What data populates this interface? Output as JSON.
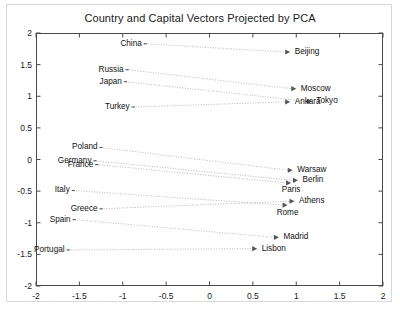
{
  "chart_data": {
    "type": "scatter",
    "title": "Country and Capital Vectors Projected by PCA",
    "xlabel": "",
    "ylabel": "",
    "xlim": [
      -2,
      2
    ],
    "ylim": [
      -2,
      2
    ],
    "grid": false,
    "legend": null,
    "xticks": [
      "-2",
      "-1.5",
      "-1",
      "-0.5",
      "0",
      "0.5",
      "1",
      "1.5",
      "2"
    ],
    "xtickvalues": [
      -2,
      -1.5,
      -1,
      -0.5,
      0,
      0.5,
      1,
      1.5,
      2
    ],
    "yticks": [
      "-2",
      "-1.5",
      "-1",
      "-0.5",
      "0",
      "0.5",
      "1",
      "1.5",
      "2"
    ],
    "ytickvalues": [
      -2,
      -1.5,
      -1,
      -0.5,
      0,
      0.5,
      1,
      1.5,
      2
    ],
    "annotation": "Each country is connected by a dotted arrow to its capital city; the country-to-capital offsets are nearly parallel.",
    "pairs": [
      {
        "country": "China",
        "capital": "Beijing",
        "country_xy": [
          -0.74,
          1.83
        ],
        "capital_xy": [
          0.93,
          1.7
        ],
        "country_anchor": "right",
        "capital_anchor": "left"
      },
      {
        "country": "Russia",
        "capital": "Moscow",
        "country_xy": [
          -0.95,
          1.42
        ],
        "capital_xy": [
          1.0,
          1.12
        ],
        "country_anchor": "right",
        "capital_anchor": "left"
      },
      {
        "country": "Japan",
        "capital": "Tokyo",
        "country_xy": [
          -0.97,
          1.23
        ],
        "capital_xy": [
          1.18,
          0.92
        ],
        "country_anchor": "right",
        "capital_anchor": "left"
      },
      {
        "country": "Turkey",
        "capital": "Ankara",
        "country_xy": [
          -0.88,
          0.83
        ],
        "capital_xy": [
          0.93,
          0.91
        ],
        "country_anchor": "right",
        "capital_anchor": "left"
      },
      {
        "country": "Poland",
        "capital": "Warsaw",
        "country_xy": [
          -1.25,
          0.19
        ],
        "capital_xy": [
          0.96,
          -0.17
        ],
        "country_anchor": "right",
        "capital_anchor": "left"
      },
      {
        "country": "Germany",
        "capital": "Berlin",
        "country_xy": [
          -1.32,
          -0.02
        ],
        "capital_xy": [
          1.02,
          -0.33
        ],
        "country_anchor": "right",
        "capital_anchor": "left"
      },
      {
        "country": "France",
        "capital": "Paris",
        "country_xy": [
          -1.3,
          -0.08
        ],
        "capital_xy": [
          0.94,
          -0.37
        ],
        "country_anchor": "right",
        "capital_anchor": "below"
      },
      {
        "country": "Italy",
        "capital": "Rome",
        "country_xy": [
          -1.57,
          -0.49
        ],
        "capital_xy": [
          0.9,
          -0.72
        ],
        "country_anchor": "right",
        "capital_anchor": "below"
      },
      {
        "country": "Greece",
        "capital": "Athens",
        "country_xy": [
          -1.25,
          -0.78
        ],
        "capital_xy": [
          0.98,
          -0.66
        ],
        "country_anchor": "right",
        "capital_anchor": "left"
      },
      {
        "country": "Spain",
        "capital": "Madrid",
        "country_xy": [
          -1.56,
          -0.95
        ],
        "capital_xy": [
          0.8,
          -1.23
        ],
        "country_anchor": "right",
        "capital_anchor": "left"
      },
      {
        "country": "Portugal",
        "capital": "Lisbon",
        "country_xy": [
          -1.63,
          -1.43
        ],
        "capital_xy": [
          0.55,
          -1.41
        ],
        "country_anchor": "right",
        "capital_anchor": "left"
      }
    ],
    "colors": {
      "axis": "#4a4a4a",
      "line": "#b0b0b0",
      "marker": "#555555",
      "text": "#111111",
      "background": "#ffffff",
      "frame": "#d8d8d8"
    }
  }
}
